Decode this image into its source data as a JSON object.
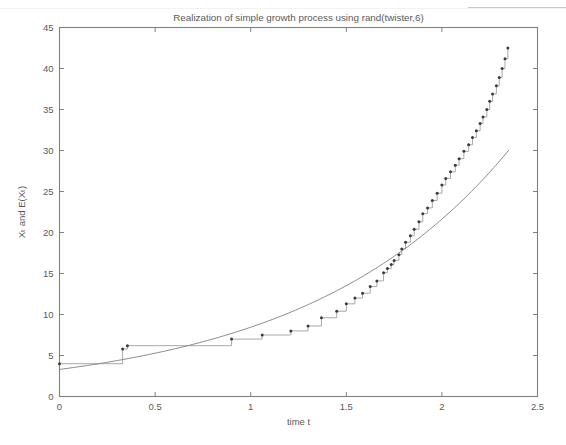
{
  "figure": {
    "background_color": "#ffffff",
    "axis_color": "#808080",
    "title": "Realization of simple growth process using rand(twister,6)"
  },
  "axes": {
    "xlabel": "time t",
    "ylabel": "Xₜ and E(Xₜ)",
    "ylabel_plain": "X_t and E(X_t)",
    "xticks": [
      "0",
      "0.5",
      "1",
      "1.5",
      "2",
      "2.5"
    ],
    "yticks": [
      "0",
      "5",
      "10",
      "15",
      "20",
      "25",
      "30",
      "35",
      "40",
      "45"
    ]
  },
  "chart_data": {
    "type": "line",
    "title": "Realization of simple growth process using rand(twister,6)",
    "xlabel": "time t",
    "ylabel": "X_t and E(X_t)",
    "xlim": [
      0,
      2.5
    ],
    "ylim": [
      0,
      45
    ],
    "xticks": [
      0,
      0.5,
      1,
      1.5,
      2,
      2.5
    ],
    "yticks": [
      0,
      5,
      10,
      15,
      20,
      25,
      30,
      35,
      40,
      45
    ],
    "grid": false,
    "legend": "none",
    "series": [
      {
        "name": "X_t",
        "style": "step-post-with-markers",
        "color": "#9a9a9a",
        "marker_color": "#3b3b3b",
        "x": [
          0,
          0.33,
          0.355,
          0.9,
          1.06,
          1.21,
          1.3,
          1.37,
          1.45,
          1.5,
          1.545,
          1.585,
          1.625,
          1.66,
          1.695,
          1.715,
          1.735,
          1.75,
          1.775,
          1.79,
          1.81,
          1.835,
          1.855,
          1.88,
          1.9,
          1.925,
          1.95,
          1.975,
          2.0,
          2.02,
          2.045,
          2.07,
          2.09,
          2.115,
          2.14,
          2.16,
          2.18,
          2.2,
          2.215,
          2.235,
          2.25,
          2.265,
          2.285,
          2.3,
          2.315,
          2.33,
          2.345
        ],
        "y": [
          4.0,
          5.8,
          6.2,
          7.0,
          7.5,
          8.0,
          8.6,
          9.6,
          10.4,
          11.3,
          12.0,
          12.6,
          13.4,
          14.1,
          15.1,
          15.6,
          16.1,
          16.6,
          17.3,
          18.0,
          18.8,
          19.6,
          20.4,
          21.3,
          22.3,
          23.0,
          23.9,
          24.8,
          25.8,
          26.6,
          27.4,
          28.2,
          29.0,
          29.9,
          30.7,
          31.6,
          32.4,
          33.3,
          34.1,
          35.0,
          36.0,
          36.9,
          37.9,
          38.9,
          40.0,
          41.2,
          42.5
        ]
      },
      {
        "name": "E(X_t)",
        "style": "smooth",
        "color": "#888888",
        "formula": "E(X_t) = 3.3 * exp(0.94 * t)",
        "x": [
          0,
          0.25,
          0.5,
          0.75,
          1.0,
          1.25,
          1.5,
          1.75,
          2.0,
          2.25,
          2.35
        ],
        "y": [
          3.3,
          4.17,
          5.28,
          6.68,
          8.45,
          10.7,
          13.53,
          17.12,
          21.66,
          27.41,
          30.0
        ]
      }
    ]
  }
}
